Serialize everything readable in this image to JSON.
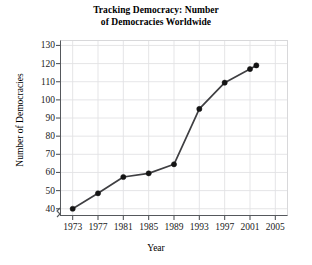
{
  "chart_data": {
    "type": "line",
    "title": "Tracking Democracy: Number\nof Democracies Worldwide",
    "title_line1": "Tracking Democracy: Number",
    "title_line2": "of Democracies Worldwide",
    "xlabel": "Year",
    "ylabel": "Number of Democracies",
    "x": [
      1973,
      1977,
      1981,
      1985,
      1989,
      1993,
      1997,
      2001,
      2002
    ],
    "values": [
      40,
      48.5,
      57.5,
      59.5,
      64.5,
      95,
      109.5,
      117,
      119
    ],
    "xlim": [
      1971,
      2007
    ],
    "ylim": [
      36,
      133
    ],
    "xticks": [
      1973,
      1977,
      1981,
      1985,
      1989,
      1993,
      1997,
      2001,
      2005
    ],
    "xtick_labels": [
      "1973",
      "1977",
      "1981",
      "1985",
      "1989",
      "1993",
      "1997",
      "2001",
      "2005"
    ],
    "yticks": [
      40,
      50,
      60,
      70,
      80,
      90,
      100,
      110,
      120,
      130
    ],
    "ytick_labels": [
      "40",
      "50",
      "60",
      "70",
      "80",
      "90",
      "100",
      "110",
      "120",
      "130"
    ],
    "grid": true,
    "legend": null,
    "axis_break": "y-axis break below 40",
    "marker": "filled-circle",
    "line_color": "#3f3f42",
    "grid_color": "#e2e2e4",
    "axis_color": "#55585c",
    "background": "#ffffff"
  }
}
